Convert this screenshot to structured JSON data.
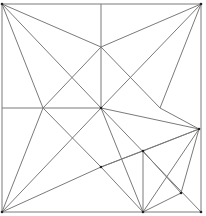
{
  "diagram": {
    "type": "geometric-line-figure",
    "stroke_color": "#7a7a7a",
    "point_color": "#222222",
    "points": {
      "TL": [
        2,
        4
      ],
      "TR": [
        201,
        4
      ],
      "BL": [
        2,
        212
      ],
      "BR": [
        201,
        212
      ],
      "T": [
        101,
        4
      ],
      "L": [
        2,
        108
      ],
      "C": [
        101,
        108
      ],
      "P1": [
        101,
        47
      ],
      "P2": [
        43,
        108
      ],
      "P3": [
        160,
        108
      ],
      "P4": [
        101,
        167
      ],
      "R": [
        199,
        129
      ],
      "Q": [
        143,
        151
      ],
      "S": [
        143,
        212
      ],
      "U": [
        181,
        193
      ]
    },
    "segments": [
      [
        "TL",
        "TR"
      ],
      [
        "TR",
        "BR"
      ],
      [
        "BR",
        "BL"
      ],
      [
        "BL",
        "TL"
      ],
      [
        "T",
        "C"
      ],
      [
        "L",
        "C"
      ],
      [
        "TL",
        "P1"
      ],
      [
        "TL",
        "C"
      ],
      [
        "TL",
        "P2"
      ],
      [
        "TR",
        "P1"
      ],
      [
        "TR",
        "C"
      ],
      [
        "TR",
        "P3"
      ],
      [
        "BL",
        "P2"
      ],
      [
        "BL",
        "C"
      ],
      [
        "BL",
        "P4"
      ],
      [
        "P2",
        "P1"
      ],
      [
        "P1",
        "P3"
      ],
      [
        "P2",
        "P4"
      ],
      [
        "C",
        "BR"
      ],
      [
        "P3",
        "R"
      ],
      [
        "C",
        "R"
      ],
      [
        "P4",
        "R"
      ],
      [
        "P4",
        "Q"
      ],
      [
        "P4",
        "S"
      ],
      [
        "C",
        "S"
      ],
      [
        "R",
        "Q"
      ],
      [
        "R",
        "U"
      ],
      [
        "R",
        "S"
      ],
      [
        "Q",
        "U"
      ],
      [
        "U",
        "S"
      ],
      [
        "Q",
        "S"
      ]
    ]
  }
}
